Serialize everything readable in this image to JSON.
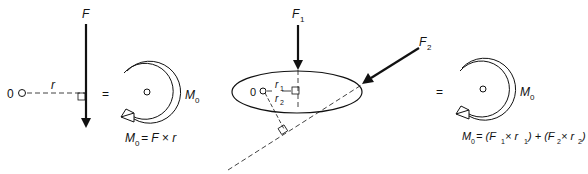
{
  "panel_single": {
    "origin_label": "0",
    "distance_label": "r",
    "force_label": "F",
    "equals": "=",
    "moment_label": "M",
    "moment_sub": "0",
    "formula": {
      "lhs": "M",
      "lhs_sub": "0",
      "rhs": "= F × r"
    }
  },
  "panel_multi": {
    "origin_label": "0",
    "force1_label": "F",
    "force1_sub": "1",
    "force2_label": "F",
    "force2_sub": "2",
    "distance1_label": "r",
    "distance1_sub": "1",
    "distance2_label": "r",
    "distance2_sub": "2",
    "equals": "=",
    "moment_label": "M",
    "moment_sub": "0",
    "formula": {
      "lhs": "M",
      "lhs_sub": "0",
      "part1": "= (F",
      "sub1": "1",
      "part2": " ×  r",
      "sub2": "1",
      "part3": ") + (F",
      "sub3": "2",
      "part4": " × r",
      "sub4": "2",
      "part5": ")"
    }
  },
  "colors": {
    "stroke": "#111111",
    "background": "#ffffff"
  }
}
